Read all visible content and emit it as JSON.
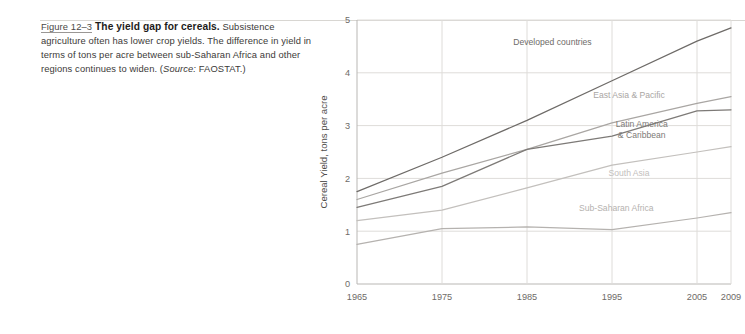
{
  "caption": {
    "figure_number": "Figure 12–3",
    "title": "The yield gap for cereals.",
    "body": " Subsistence agriculture often has lower crop yields. The difference in yield in terms of tons per acre between sub-Saharan Africa and other regions continues to widen. (",
    "source_italic": "Source:",
    "source_text": " FAOSTAT.)"
  },
  "chart_data": {
    "type": "line",
    "title": "",
    "xlabel": "",
    "ylabel": "Cereal Yield, tons per acre",
    "x": [
      1965,
      1975,
      1985,
      1995,
      2005,
      2009
    ],
    "xtick_labels": [
      "1965",
      "1975",
      "1985",
      "1995",
      "2005",
      "2009"
    ],
    "ytick_labels": [
      "0",
      "1",
      "2",
      "3",
      "4",
      "5"
    ],
    "yticks": [
      0,
      1,
      2,
      3,
      4,
      5
    ],
    "ylim": [
      0,
      5
    ],
    "xlim": [
      1965,
      2009
    ],
    "grid": "xy",
    "legend_position": "inline-annotations",
    "series": [
      {
        "name": "Developed countries",
        "color": "#6e6b68",
        "values": [
          1.75,
          2.4,
          3.1,
          3.85,
          4.6,
          4.85
        ],
        "label_x": 1988,
        "label_y": 4.52
      },
      {
        "name": "East Asia & Pacific",
        "color": "#a9a6a3",
        "values": [
          1.6,
          2.1,
          2.55,
          3.05,
          3.42,
          3.55
        ],
        "label_x": 1997,
        "label_y": 3.52
      },
      {
        "name": "Latin America & Caribbean",
        "color": "#7d7a77",
        "values": [
          1.45,
          1.85,
          2.55,
          2.8,
          3.28,
          3.3
        ],
        "label_x": 1998.5,
        "label_y": 2.98
      },
      {
        "name": "South Asia",
        "color": "#c3c0bd",
        "values": [
          1.2,
          1.4,
          1.82,
          2.25,
          2.5,
          2.6
        ],
        "label_x": 1997,
        "label_y": 2.05
      },
      {
        "name": "Sub-Saharan Africa",
        "color": "#b5b2af",
        "values": [
          0.75,
          1.05,
          1.08,
          1.03,
          1.25,
          1.35
        ],
        "label_x": 1995.5,
        "label_y": 1.38
      }
    ]
  }
}
